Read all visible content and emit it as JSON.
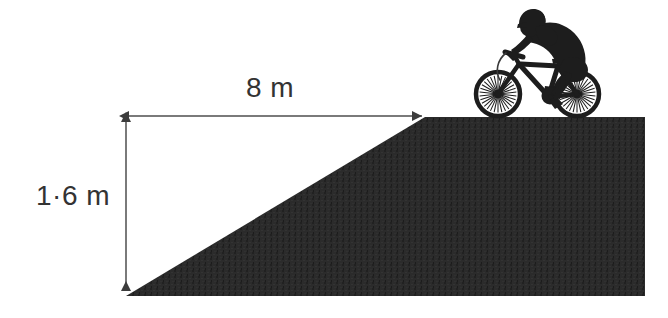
{
  "diagram": {
    "colors": {
      "ramp_fill": "#2b2b2b",
      "dimension_line": "#7a7a7a",
      "label_text": "#333333",
      "background": "#ffffff",
      "silhouette": "#1d1d1d"
    },
    "labels": {
      "base": "8 m",
      "height": "1·6 m"
    },
    "dimensions": {
      "base_value": 8,
      "base_unit": "m",
      "height_value": 1.6,
      "height_unit": "m",
      "decimal_separator": "middle-dot"
    },
    "shapes": {
      "ramp_description": "solid dark ramp: sloped incline rising left-to-right to a flat plateau",
      "ramp_points": "126,296 425,117 645,117 645,296",
      "rider_description": "cyclist silhouette on mountain bike at top of ramp"
    },
    "icons": {
      "cyclist": "cyclist-silhouette-icon",
      "base_arrow": "double-headed-horizontal-arrow-icon",
      "height_arrow": "double-headed-vertical-arrow-icon"
    }
  }
}
